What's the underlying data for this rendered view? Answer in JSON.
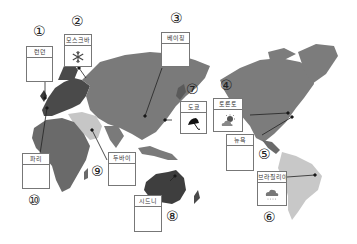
{
  "colors": {
    "europe": "#4a4a4a",
    "asia": "#7a7a7a",
    "middle_east": "#c6c6c6",
    "africa": "#6a6a6a",
    "oceania": "#3e3e3e",
    "north_america": "#7c7c7c",
    "south_america": "#c8c8c8",
    "box_border": "#777777"
  },
  "cities": [
    {
      "num": "①",
      "name": "런던",
      "icon": "empty"
    },
    {
      "num": "②",
      "name": "모스크바",
      "icon": "snowflake-icon"
    },
    {
      "num": "③",
      "name": "베이징",
      "icon": "empty"
    },
    {
      "num": "④",
      "name": "토론토",
      "icon": "sun-behind-cloud-icon"
    },
    {
      "num": "⑤",
      "name": "뉴욕",
      "icon": "empty"
    },
    {
      "num": "⑥",
      "name": "브라질리아",
      "icon": "rain-cloud-icon"
    },
    {
      "num": "⑦",
      "name": "도쿄",
      "icon": "umbrella-icon"
    },
    {
      "num": "⑧",
      "name": "시드니",
      "icon": "empty"
    },
    {
      "num": "⑨",
      "name": "두바이",
      "icon": "empty"
    },
    {
      "num": "⑩",
      "name": "파리",
      "icon": "empty"
    }
  ]
}
